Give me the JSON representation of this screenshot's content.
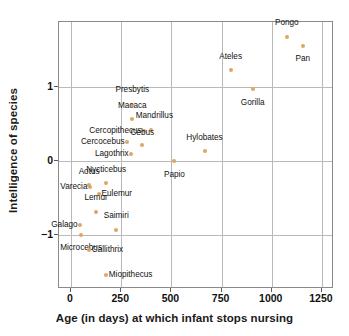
{
  "chart_data": {
    "type": "scatter",
    "title": "",
    "xlabel": "Age (in days) at which infant stops nursing",
    "ylabel": "Intelligence of species",
    "xlim": [
      -60,
      1310
    ],
    "ylim": [
      -1.72,
      1.87
    ],
    "xticks": [
      0,
      250,
      500,
      750,
      1000,
      1250
    ],
    "xticklabels": [
      "0",
      "250",
      "500",
      "750",
      "1000",
      "1250"
    ],
    "yticks": [
      1,
      0,
      -1
    ],
    "yticklabels": [
      "1",
      "0",
      "−1"
    ],
    "grid": true,
    "legend": null,
    "marker_color": "#e0a464",
    "points": [
      {
        "label": "Pongo",
        "x": 1075,
        "y": 1.67,
        "lx": 1075,
        "ly": 1.8,
        "pos": "top"
      },
      {
        "label": "Pan",
        "x": 1155,
        "y": 1.55,
        "lx": 1155,
        "ly": 1.42,
        "pos": "bottom"
      },
      {
        "label": "Ateles",
        "x": 795,
        "y": 1.22,
        "lx": 795,
        "ly": 1.35,
        "pos": "top"
      },
      {
        "label": "Gorilla",
        "x": 905,
        "y": 0.97,
        "lx": 905,
        "ly": 0.84,
        "pos": "bottom"
      },
      {
        "label": "Presbytis",
        "x": 305,
        "y": 0.76,
        "lx": 305,
        "ly": 0.9,
        "pos": "top"
      },
      {
        "label": "Macaca",
        "x": 305,
        "y": 0.56,
        "lx": 305,
        "ly": 0.69,
        "pos": "top"
      },
      {
        "label": "Mandrillus",
        "x": 400,
        "y": 0.42,
        "lx": 415,
        "ly": 0.55,
        "pos": "top"
      },
      {
        "label": "Cercopithecus",
        "x": 365,
        "y": 0.4,
        "lx": 352,
        "ly": 0.4,
        "pos": "left"
      },
      {
        "label": "Cercocebus",
        "x": 280,
        "y": 0.26,
        "lx": 267,
        "ly": 0.26,
        "pos": "left"
      },
      {
        "label": "Cebus",
        "x": 355,
        "y": 0.21,
        "lx": 355,
        "ly": 0.33,
        "pos": "top"
      },
      {
        "label": "Hylobates",
        "x": 665,
        "y": 0.13,
        "lx": 665,
        "ly": 0.26,
        "pos": "top"
      },
      {
        "label": "Lagothrix",
        "x": 300,
        "y": 0.1,
        "lx": 287,
        "ly": 0.1,
        "pos": "left"
      },
      {
        "label": "Papio",
        "x": 515,
        "y": 0.0,
        "lx": 515,
        "ly": -0.13,
        "pos": "bottom"
      },
      {
        "label": "Nycticebus",
        "x": 175,
        "y": -0.3,
        "lx": 175,
        "ly": -0.17,
        "pos": "top"
      },
      {
        "label": "Aotus",
        "x": 90,
        "y": -0.32,
        "lx": 90,
        "ly": -0.2,
        "pos": "top"
      },
      {
        "label": "Varecia",
        "x": 95,
        "y": -0.35,
        "lx": 82,
        "ly": -0.35,
        "pos": "left"
      },
      {
        "label": "Eulemur",
        "x": 140,
        "y": -0.44,
        "lx": 152,
        "ly": -0.44,
        "pos": "right"
      },
      {
        "label": "Lemur",
        "x": 125,
        "y": -0.68,
        "lx": 125,
        "ly": -0.55,
        "pos": "top"
      },
      {
        "label": "Saimiri",
        "x": 225,
        "y": -0.92,
        "lx": 225,
        "ly": -0.79,
        "pos": "top"
      },
      {
        "label": "Galago",
        "x": 45,
        "y": -0.86,
        "lx": 33,
        "ly": -0.86,
        "pos": "left"
      },
      {
        "label": "Microcebus",
        "x": 50,
        "y": -1.0,
        "lx": 50,
        "ly": -1.11,
        "pos": "bottom"
      },
      {
        "label": "Callithrix",
        "x": 90,
        "y": -1.19,
        "lx": 103,
        "ly": -1.19,
        "pos": "right"
      },
      {
        "label": "Miopithecus",
        "x": 175,
        "y": -1.53,
        "lx": 188,
        "ly": -1.53,
        "pos": "right"
      }
    ]
  }
}
